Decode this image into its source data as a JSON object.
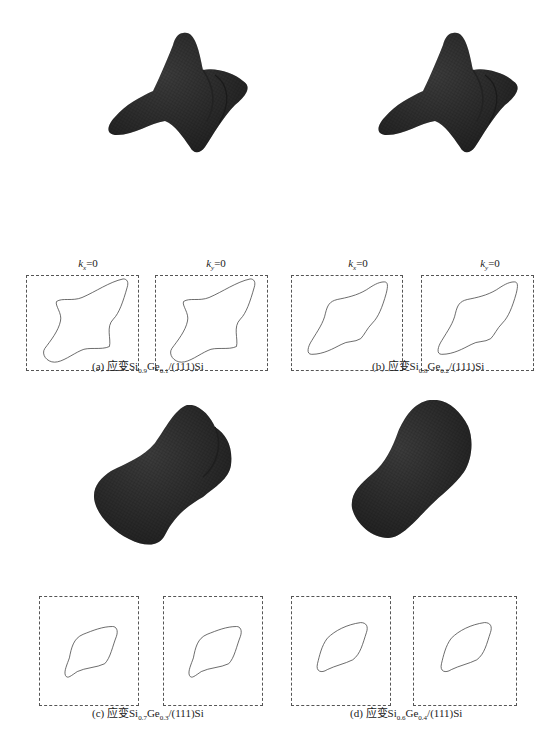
{
  "figure": {
    "panels": [
      {
        "id": "a",
        "tag": "(a)",
        "caption_prefix": "应变",
        "si": "Si",
        "si_sub": "0.9",
        "ge": "Ge",
        "ge_sub": "0.1",
        "caption_suffix": "/(111)Si",
        "surface_shape": "four-lobed star",
        "slices": [
          {
            "var": "k",
            "sub": "x",
            "eq": "=0"
          },
          {
            "var": "k",
            "sub": "y",
            "eq": "=0"
          }
        ]
      },
      {
        "id": "b",
        "tag": "(b)",
        "caption_prefix": "应变",
        "si": "Si",
        "si_sub": "0.8",
        "ge": "Ge",
        "ge_sub": "0.2",
        "caption_suffix": "/(111)Si",
        "surface_shape": "four-lobed star",
        "slices": [
          {
            "var": "k",
            "sub": "x",
            "eq": "=0"
          },
          {
            "var": "k",
            "sub": "y",
            "eq": "=0"
          }
        ]
      },
      {
        "id": "c",
        "tag": "(c)",
        "caption_prefix": "应变",
        "si": "Si",
        "si_sub": "0.7",
        "ge": "Ge",
        "ge_sub": "0.3",
        "caption_suffix": "/(111)Si",
        "surface_shape": "peanut",
        "slices": [
          {
            "var": "k",
            "sub": "x",
            "eq": "=0"
          },
          {
            "var": "k",
            "sub": "y",
            "eq": "=0"
          }
        ]
      },
      {
        "id": "d",
        "tag": "(d)",
        "caption_prefix": "应变",
        "si": "Si",
        "si_sub": "0.6",
        "ge": "Ge",
        "ge_sub": "0.4",
        "caption_suffix": "/(111)Si",
        "surface_shape": "peanut",
        "slices": [
          {
            "var": "k",
            "sub": "x",
            "eq": "=0"
          },
          {
            "var": "k",
            "sub": "y",
            "eq": "=0"
          }
        ]
      }
    ],
    "colors": {
      "surface": "#3a3a3a",
      "surface_dark": "#1e1e1e",
      "contour": "#444444",
      "frame": "#555555"
    }
  }
}
